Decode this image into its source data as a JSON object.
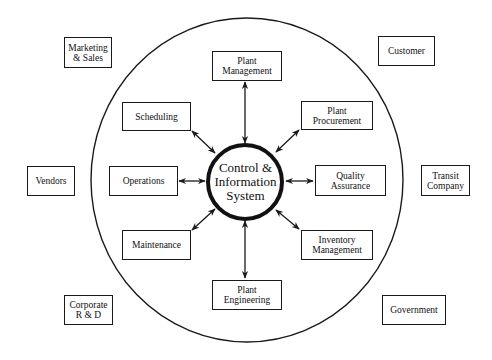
{
  "diagram": {
    "center": {
      "label": "Control &\nInformation\nSystem"
    },
    "inner_nodes": [
      {
        "id": "plant-management",
        "label": "Plant\nManagement"
      },
      {
        "id": "plant-procurement",
        "label": "Plant\nProcurement"
      },
      {
        "id": "quality-assurance",
        "label": "Quality\nAssurance"
      },
      {
        "id": "inventory-management",
        "label": "Inventory\nManagement"
      },
      {
        "id": "plant-engineering",
        "label": "Plant\nEngineering"
      },
      {
        "id": "maintenance",
        "label": "Maintenance"
      },
      {
        "id": "operations",
        "label": "Operations"
      },
      {
        "id": "scheduling",
        "label": "Scheduling"
      }
    ],
    "outer_nodes": [
      {
        "id": "marketing-sales",
        "label": "Marketing\n& Sales"
      },
      {
        "id": "customer",
        "label": "Customer"
      },
      {
        "id": "vendors",
        "label": "Vendors"
      },
      {
        "id": "transit-company",
        "label": "Transit\nCompany"
      },
      {
        "id": "corporate-rd",
        "label": "Corporate\nR & D"
      },
      {
        "id": "government",
        "label": "Government"
      }
    ],
    "connections": [
      "Control & Information System <-> Plant Management",
      "Control & Information System <-> Plant Procurement",
      "Control & Information System <-> Quality Assurance",
      "Control & Information System <-> Inventory Management",
      "Control & Information System <-> Plant Engineering",
      "Control & Information System <-> Maintenance",
      "Control & Information System <-> Operations",
      "Control & Information System <-> Scheduling"
    ],
    "colors": {
      "line": "#1a1a1a",
      "background": "#ffffff"
    }
  }
}
